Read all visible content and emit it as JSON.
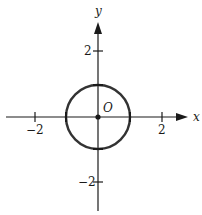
{
  "figure": {
    "type": "coordinate-plane-circle",
    "x_axis_label": "x",
    "y_axis_label": "y",
    "origin_label": "O",
    "x_ticks": [
      {
        "value": -2,
        "label": "−2"
      },
      {
        "value": 2,
        "label": "2"
      }
    ],
    "y_ticks": [
      {
        "value": 2,
        "label": "2"
      },
      {
        "value": -2,
        "label": "−2"
      }
    ],
    "circle": {
      "center": [
        0,
        0
      ],
      "radius": 1
    },
    "highlighted_points": [
      [
        0,
        0
      ],
      [
        1,
        0
      ],
      [
        -1,
        0
      ],
      [
        0,
        1
      ],
      [
        0,
        -1
      ]
    ],
    "colors": {
      "stroke": "#1a1a1a",
      "circle": "#333333"
    }
  }
}
